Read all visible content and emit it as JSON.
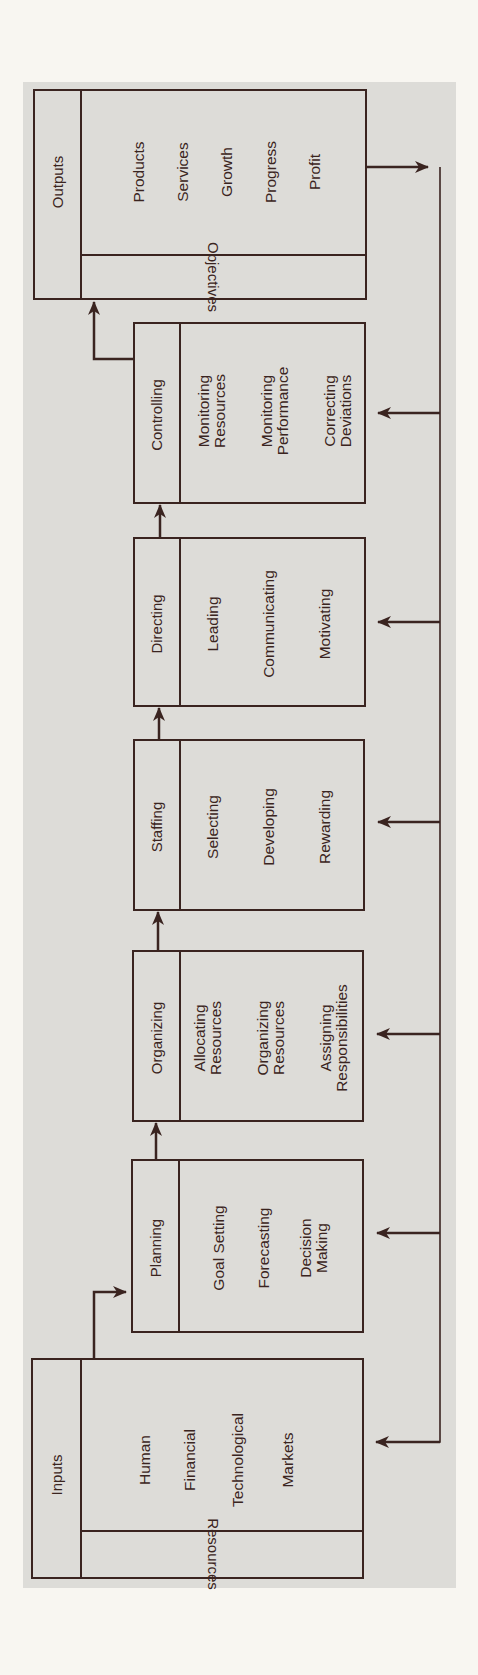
{
  "colors": {
    "background": "#f8f6f1",
    "panel": "#dddcd8",
    "line": "#3a2420"
  },
  "diagram": {
    "orientation": "rotated 90 degrees; flow reads bottom to top",
    "outputs": {
      "title": "Outputs",
      "items": [
        "Products",
        "Services",
        "Growth",
        "Progress",
        "Profit"
      ],
      "footer": "Objectives"
    },
    "functions": [
      {
        "title": "Controlling",
        "items": [
          "Monitoring\nResources",
          "Monitoring\nPerformance",
          "Correcting\nDeviations"
        ]
      },
      {
        "title": "Directing",
        "items": [
          "Leading",
          "Communicating",
          "Motivating"
        ]
      },
      {
        "title": "Staffing",
        "items": [
          "Selecting",
          "Developing",
          "Rewarding"
        ]
      },
      {
        "title": "Organizing",
        "items": [
          "Allocating\nResources",
          "Organizing\nResources",
          "Assigning\nResponsibilities"
        ]
      },
      {
        "title": "Planning",
        "items": [
          "Goal Setting",
          "Forecasting",
          "Decision\nMaking"
        ]
      }
    ],
    "inputs": {
      "title": "Inputs",
      "items": [
        "Human",
        "Financial",
        "Technological",
        "Markets"
      ],
      "footer": "Resources"
    },
    "connections": [
      {
        "from": "Inputs",
        "to": "Planning",
        "type": "flow"
      },
      {
        "from": "Planning",
        "to": "Organizing",
        "type": "flow"
      },
      {
        "from": "Organizing",
        "to": "Staffing",
        "type": "flow"
      },
      {
        "from": "Staffing",
        "to": "Directing",
        "type": "flow"
      },
      {
        "from": "Directing",
        "to": "Controlling",
        "type": "flow"
      },
      {
        "from": "Controlling",
        "to": "Outputs",
        "type": "flow"
      },
      {
        "from": "Outputs",
        "to": [
          "Controlling",
          "Directing",
          "Staffing",
          "Organizing",
          "Planning",
          "Inputs"
        ],
        "type": "feedback"
      }
    ]
  }
}
